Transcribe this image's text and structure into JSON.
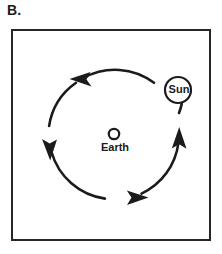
{
  "figure": {
    "panel_letter": "B.",
    "caption": ""
  },
  "diagram": {
    "type": "orbit-diagram",
    "frame": {
      "stroke_color": "#262626",
      "fill_color": "#ffffff",
      "stroke_width": 2
    },
    "center_body": {
      "name": "Earth",
      "label": "Earth",
      "shape": "open-circle",
      "cx": 101,
      "cy": 103,
      "r": 5.2,
      "stroke_color": "#1b1b1b"
    },
    "orbiting_body": {
      "name": "Sun",
      "label": "Sun",
      "shape": "open-circle",
      "cx": 165,
      "cy": 59,
      "r": 13,
      "stroke_color": "#1b1b1b"
    },
    "orbit": {
      "cx": 101,
      "cy": 103,
      "r": 65,
      "stroke_color": "#1b1b1b",
      "stroke_width": 2.4,
      "direction": "counterclockwise"
    },
    "arrows": [
      {
        "name": "arrow-top",
        "position": "top",
        "points": "left",
        "angle_deg": 110
      },
      {
        "name": "arrow-left",
        "position": "left",
        "points": "down",
        "angle_deg": 190
      },
      {
        "name": "arrow-bottom",
        "position": "bottom",
        "points": "right",
        "angle_deg": 285
      },
      {
        "name": "arrow-right",
        "position": "right",
        "points": "up",
        "angle_deg": 20
      }
    ]
  },
  "colors": {
    "ink": "#1b1b1b",
    "frame": "#262626",
    "background": "#ffffff"
  }
}
